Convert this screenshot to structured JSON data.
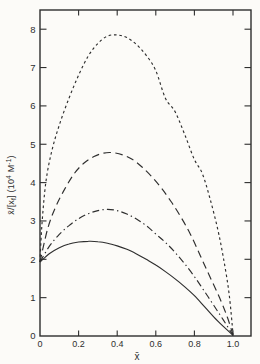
{
  "figure": {
    "background": "#fcfbf8",
    "ink": "#2e2e2e"
  },
  "chart_data": {
    "type": "line",
    "title": "",
    "xlabel": "x̄",
    "ylabel": "x̄/[xf] (10⁴ M⁻¹)",
    "ylabel_parts": [
      {
        "t": "x̄/[x",
        "s": "n"
      },
      {
        "t": "f",
        "s": "sub"
      },
      {
        "t": "]  (10",
        "s": "n"
      },
      {
        "t": "4",
        "s": "sup"
      },
      {
        "t": " M",
        "s": "n"
      },
      {
        "t": "-1",
        "s": "sup"
      },
      {
        "t": ")",
        "s": "n"
      }
    ],
    "xlim": [
      0,
      1.09
    ],
    "ylim": [
      0,
      8.5
    ],
    "grid": false,
    "legend": null,
    "x_ticks": [
      0,
      0.2,
      0.4,
      0.6,
      0.8,
      1.0
    ],
    "x_tick_labels": [
      "0",
      "0.2",
      "0.4",
      "0.6",
      "0.8",
      "1.0"
    ],
    "y_ticks": [
      0,
      1,
      2,
      3,
      4,
      5,
      6,
      7,
      8
    ],
    "y_tick_labels": [
      "0",
      "1",
      "2",
      "3",
      "4",
      "5",
      "6",
      "7",
      "8"
    ],
    "series": [
      {
        "name": "curve-short-dash",
        "line_style": "short-dash",
        "points": [
          [
            0,
            1.93
          ],
          [
            0.01,
            2.9
          ],
          [
            0.03,
            4.0
          ],
          [
            0.06,
            4.8
          ],
          [
            0.1,
            5.5
          ],
          [
            0.15,
            6.2
          ],
          [
            0.2,
            6.8
          ],
          [
            0.25,
            7.3
          ],
          [
            0.3,
            7.63
          ],
          [
            0.35,
            7.82
          ],
          [
            0.4,
            7.85
          ],
          [
            0.45,
            7.78
          ],
          [
            0.5,
            7.6
          ],
          [
            0.55,
            7.32
          ],
          [
            0.6,
            6.92
          ],
          [
            0.65,
            6.2
          ],
          [
            0.7,
            5.85
          ],
          [
            0.75,
            5.25
          ],
          [
            0.8,
            4.6
          ],
          [
            0.84,
            4.25
          ],
          [
            0.88,
            3.6
          ],
          [
            0.92,
            2.8
          ],
          [
            0.95,
            2.05
          ],
          [
            0.98,
            1.1
          ],
          [
            1.0,
            0.05
          ]
        ]
      },
      {
        "name": "curve-long-dash",
        "line_style": "long-dash",
        "points": [
          [
            0,
            1.93
          ],
          [
            0.04,
            2.8
          ],
          [
            0.08,
            3.35
          ],
          [
            0.13,
            3.85
          ],
          [
            0.18,
            4.25
          ],
          [
            0.23,
            4.52
          ],
          [
            0.28,
            4.68
          ],
          [
            0.33,
            4.77
          ],
          [
            0.38,
            4.78
          ],
          [
            0.43,
            4.72
          ],
          [
            0.48,
            4.6
          ],
          [
            0.53,
            4.4
          ],
          [
            0.58,
            4.15
          ],
          [
            0.63,
            3.85
          ],
          [
            0.68,
            3.5
          ],
          [
            0.73,
            3.1
          ],
          [
            0.78,
            2.65
          ],
          [
            0.83,
            2.1
          ],
          [
            0.88,
            1.55
          ],
          [
            0.93,
            1.0
          ],
          [
            0.97,
            0.5
          ],
          [
            1.0,
            0.03
          ]
        ]
      },
      {
        "name": "curve-dash-dot",
        "line_style": "dash-dot",
        "points": [
          [
            0,
            1.93
          ],
          [
            0.05,
            2.35
          ],
          [
            0.1,
            2.65
          ],
          [
            0.15,
            2.88
          ],
          [
            0.2,
            3.06
          ],
          [
            0.25,
            3.19
          ],
          [
            0.3,
            3.27
          ],
          [
            0.35,
            3.3
          ],
          [
            0.4,
            3.27
          ],
          [
            0.45,
            3.18
          ],
          [
            0.5,
            3.05
          ],
          [
            0.55,
            2.88
          ],
          [
            0.6,
            2.66
          ],
          [
            0.65,
            2.44
          ],
          [
            0.7,
            2.18
          ],
          [
            0.75,
            1.88
          ],
          [
            0.8,
            1.55
          ],
          [
            0.85,
            1.18
          ],
          [
            0.9,
            0.8
          ],
          [
            0.95,
            0.42
          ],
          [
            1.0,
            0.02
          ]
        ]
      },
      {
        "name": "curve-solid",
        "line_style": "solid",
        "points": [
          [
            0,
            1.93
          ],
          [
            0.05,
            2.15
          ],
          [
            0.1,
            2.3
          ],
          [
            0.15,
            2.4
          ],
          [
            0.2,
            2.45
          ],
          [
            0.25,
            2.47
          ],
          [
            0.3,
            2.46
          ],
          [
            0.35,
            2.42
          ],
          [
            0.4,
            2.35
          ],
          [
            0.45,
            2.26
          ],
          [
            0.5,
            2.14
          ],
          [
            0.55,
            2.0
          ],
          [
            0.6,
            1.85
          ],
          [
            0.65,
            1.68
          ],
          [
            0.7,
            1.49
          ],
          [
            0.75,
            1.28
          ],
          [
            0.8,
            1.05
          ],
          [
            0.85,
            0.78
          ],
          [
            0.9,
            0.5
          ],
          [
            0.95,
            0.25
          ],
          [
            1.0,
            0.02
          ]
        ]
      }
    ]
  }
}
